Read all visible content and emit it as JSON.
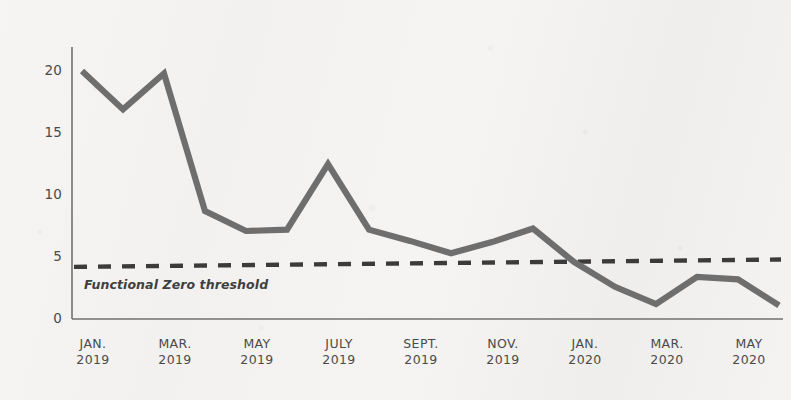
{
  "chart_data": {
    "type": "line",
    "title": "",
    "subtitle": "",
    "xlabel": "",
    "ylabel": "",
    "ylim": [
      0,
      22
    ],
    "yticks": [
      0,
      5,
      10,
      15,
      20
    ],
    "ytick_labels": [
      "0",
      "5",
      "10",
      "15",
      "20"
    ],
    "grid": false,
    "legend": "none",
    "xtick_labels": [
      {
        "month": "JAN.",
        "year": "2019"
      },
      {
        "month": "MAR.",
        "year": "2019"
      },
      {
        "month": "MAY",
        "year": "2019"
      },
      {
        "month": "JULY",
        "year": "2019"
      },
      {
        "month": "SEPT.",
        "year": "2019"
      },
      {
        "month": "NOV.",
        "year": "2019"
      },
      {
        "month": "JAN.",
        "year": "2020"
      },
      {
        "month": "MAR.",
        "year": "2020"
      },
      {
        "month": "MAY",
        "year": "2020"
      }
    ],
    "x": [
      "JAN. 2019",
      "FEB. 2019",
      "MAR. 2019",
      "APR. 2019",
      "MAY 2019",
      "JUNE 2019",
      "JULY 2019",
      "AUG. 2019",
      "SEPT. 2019",
      "OCT. 2019",
      "NOV. 2019",
      "DEC. 2019",
      "JAN. 2020",
      "FEB. 2020",
      "MAR. 2020",
      "APR. 2020",
      "MAY 2020",
      "JUNE 2020"
    ],
    "series": [
      {
        "name": "Homeless veterans",
        "color": "#6e6e6e",
        "values": [
          20.0,
          16.9,
          19.8,
          8.7,
          7.1,
          7.2,
          12.5,
          7.2,
          6.3,
          5.3,
          6.2,
          7.3,
          4.6,
          2.6,
          1.2,
          3.4,
          3.2,
          1.1
        ]
      }
    ],
    "threshold_line": {
      "label": "Functional Zero threshold",
      "value_left": 4.2,
      "value_right": 4.8,
      "style": "dashed",
      "color": "#3b3b3b"
    },
    "axis_color": "#707070",
    "text_color": "#4a4a4a",
    "background_color": "#f4f3f1"
  }
}
